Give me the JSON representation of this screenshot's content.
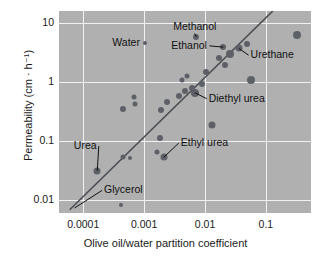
{
  "chart_data": {
    "type": "scatter",
    "title": "",
    "xlabel": "Olive oil/water partition coefficient",
    "ylabel": "Permeability (cm · h⁻¹)",
    "xscale": "log",
    "yscale": "log",
    "xlim": [
      4e-05,
      0.55
    ],
    "ylim": [
      0.006,
      16
    ],
    "grid": true,
    "legend": "none",
    "xticks": [
      "0.0001",
      "0.001",
      "0.01",
      "0.1"
    ],
    "xtick_values": [
      0.0001,
      0.001,
      0.01,
      0.1
    ],
    "yticks": [
      "10",
      "1",
      "0.1",
      "0.01"
    ],
    "ytick_values": [
      10,
      1,
      0.1,
      0.01
    ],
    "fit_line": {
      "label": "regression line",
      "x_start": 6e-05,
      "y_start": 0.0068,
      "x_end": 0.13,
      "y_end": 16.0
    },
    "points": [
      {
        "name": "Glycerol",
        "x": 0.00042,
        "y": 0.0082,
        "size": 4
      },
      {
        "name": "Urea",
        "x": 0.00017,
        "y": 0.031,
        "size": 7
      },
      {
        "name": "unlabeled-1",
        "x": 0.00045,
        "y": 0.054,
        "size": 5
      },
      {
        "name": "unlabeled-2",
        "x": 0.00058,
        "y": 0.051,
        "size": 4
      },
      {
        "name": "unlabeled-3",
        "x": 0.0016,
        "y": 0.065,
        "size": 5
      },
      {
        "name": "Ethyl urea",
        "x": 0.0021,
        "y": 0.053,
        "size": 7
      },
      {
        "name": "unlabeled-4",
        "x": 0.0018,
        "y": 0.112,
        "size": 6
      },
      {
        "name": "unlabeled-5",
        "x": 0.00045,
        "y": 0.35,
        "size": 6
      },
      {
        "name": "unlabeled-6",
        "x": 0.00068,
        "y": 0.56,
        "size": 5
      },
      {
        "name": "unlabeled-7",
        "x": 0.00072,
        "y": 0.42,
        "size": 5
      },
      {
        "name": "unlabeled-8",
        "x": 0.0019,
        "y": 0.33,
        "size": 6
      },
      {
        "name": "unlabeled-9",
        "x": 0.0024,
        "y": 0.45,
        "size": 6
      },
      {
        "name": "unlabeled-10",
        "x": 0.0037,
        "y": 0.59,
        "size": 6
      },
      {
        "name": "unlabeled-11",
        "x": 0.0047,
        "y": 0.7,
        "size": 6
      },
      {
        "name": "unlabeled-12",
        "x": 0.0042,
        "y": 1.1,
        "size": 5
      },
      {
        "name": "unlabeled-13",
        "x": 0.005,
        "y": 1.28,
        "size": 5
      },
      {
        "name": "unlabeled-14",
        "x": 0.0062,
        "y": 0.8,
        "size": 6
      },
      {
        "name": "Diethyl urea",
        "x": 0.0068,
        "y": 0.66,
        "size": 8
      },
      {
        "name": "unlabeled-15",
        "x": 0.009,
        "y": 0.92,
        "size": 6
      },
      {
        "name": "unlabeled-16",
        "x": 0.0105,
        "y": 1.45,
        "size": 6
      },
      {
        "name": "unlabeled-17",
        "x": 0.013,
        "y": 0.185,
        "size": 7
      },
      {
        "name": "Methanol",
        "x": 0.0072,
        "y": 5.8,
        "size": 6
      },
      {
        "name": "unlabeled-18",
        "x": 0.017,
        "y": 2.55,
        "size": 6
      },
      {
        "name": "Ethanol",
        "x": 0.02,
        "y": 3.9,
        "size": 6
      },
      {
        "name": "unlabeled-19",
        "x": 0.021,
        "y": 1.95,
        "size": 6
      },
      {
        "name": "unlabeled-20",
        "x": 0.026,
        "y": 3.0,
        "size": 8
      },
      {
        "name": "Urethane",
        "x": 0.036,
        "y": 3.7,
        "size": 7
      },
      {
        "name": "unlabeled-21",
        "x": 0.048,
        "y": 4.4,
        "size": 6
      },
      {
        "name": "unlabeled-22",
        "x": 0.057,
        "y": 1.08,
        "size": 8
      },
      {
        "name": "Water",
        "x": 0.00105,
        "y": 4.5,
        "size": 4
      },
      {
        "name": "unlabeled-23",
        "x": 0.33,
        "y": 6.2,
        "size": 8
      }
    ],
    "annotations": [
      {
        "label": "Water",
        "text_x": 0.0003,
        "text_y": 4.5,
        "anchor": "start",
        "leader": false
      },
      {
        "label": "Methanol",
        "text_x": 0.003,
        "text_y": 8.4,
        "anchor": "start",
        "leader": true,
        "target_x": 0.0072,
        "target_y": 5.8
      },
      {
        "label": "Ethanol",
        "text_x": 0.0028,
        "text_y": 4.1,
        "anchor": "start",
        "leader": true,
        "target_x": 0.02,
        "target_y": 3.9
      },
      {
        "label": "Urethane",
        "text_x": 0.056,
        "text_y": 2.85,
        "anchor": "start",
        "leader": true,
        "target_x": 0.036,
        "target_y": 3.7
      },
      {
        "label": "Diethyl urea",
        "text_x": 0.0115,
        "text_y": 0.52,
        "anchor": "start",
        "leader": true,
        "target_x": 0.0068,
        "target_y": 0.66
      },
      {
        "label": "Ethyl urea",
        "text_x": 0.004,
        "text_y": 0.092,
        "anchor": "start",
        "leader": true,
        "target_x": 0.0021,
        "target_y": 0.053
      },
      {
        "label": "Urea",
        "text_x": 7e-05,
        "text_y": 0.082,
        "anchor": "start",
        "leader": true,
        "target_x": 0.00017,
        "target_y": 0.031
      },
      {
        "label": "Glycerol",
        "text_x": 0.00022,
        "text_y": 0.0145,
        "anchor": "start",
        "leader": true,
        "target_x": 7.2e-05,
        "target_y": 0.0073
      }
    ]
  },
  "colors": {
    "plot_background": "#b0b0b0",
    "gridline": "#f2f2f2",
    "point": "#5d6066",
    "fit_line": "#4a4d52",
    "text": "#111111",
    "page_background": "#ffffff"
  }
}
